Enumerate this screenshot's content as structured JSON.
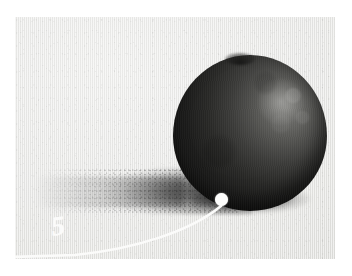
{
  "plate": {
    "title": "Tonal study of a spherical fruit with cast shadow",
    "medium": "graphite / charcoal on toned paper",
    "background_color": "#ffffff",
    "paper_color": "#e9e9e7",
    "frame": {
      "x": 15,
      "y": 17,
      "width": 320,
      "height": 242
    }
  },
  "subject": {
    "name": "fruit-sphere",
    "description": "dark round fruit rendered in graphite, lit from upper right",
    "darkest_tone": "#161615",
    "midtone": "#3d3d3b",
    "highlight_tone": "#b9b9b6",
    "highlight_position": "upper-right",
    "bounds": {
      "x": 158,
      "y": 38,
      "width": 154,
      "height": 156
    }
  },
  "shadow": {
    "name": "cast-shadow",
    "description": "long grainy cast shadow extending to the lower left",
    "tone": "#2d2d2b",
    "direction": "left",
    "bounds": {
      "x": 18,
      "y": 150,
      "width": 219,
      "height": 48
    }
  },
  "annotation": {
    "label": "5",
    "label_color": "#fbfbfa",
    "dot_color": "#fdfdfc",
    "line_color": "#fbfbfa",
    "dot_position": {
      "x": 206,
      "y": 182
    },
    "label_position": {
      "x": 43,
      "y": 209
    },
    "leader_path": "M 206 189 C 176 214 120 232 60 238 L 0 240",
    "icon": "callout-dot-icon"
  }
}
